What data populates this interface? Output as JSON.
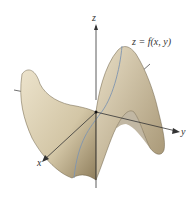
{
  "diagram": {
    "type": "3d-surface-saddle",
    "surface_label": "z = f(x, y)",
    "axes": {
      "x": "x",
      "y": "y",
      "z": "z"
    },
    "colors": {
      "surface": "#d8ccb0",
      "surface_shadow": "#9a8a68",
      "axis": "#333333",
      "trace_curve": "#7f95b0"
    }
  }
}
